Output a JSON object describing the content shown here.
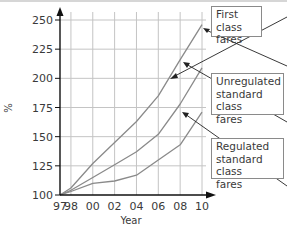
{
  "chart_data": {
    "type": "line",
    "title": "",
    "xlabel": "Year",
    "ylabel": "%",
    "x": [
      "97",
      "98",
      "00",
      "02",
      "04",
      "06",
      "08",
      "10"
    ],
    "x_numeric": [
      1997,
      1998,
      2000,
      2002,
      2004,
      2006,
      2008,
      2010
    ],
    "ylim": [
      100,
      250
    ],
    "yticks": [
      "100",
      "125",
      "150",
      "175",
      "200",
      "225",
      "250"
    ],
    "xticks": [
      "97",
      "98",
      "00",
      "02",
      "04",
      "06",
      "08",
      "10"
    ],
    "grid": true,
    "series": [
      {
        "name": "First class fares",
        "values": [
          100,
          106,
          127,
          145,
          163,
          185,
          216,
          246
        ]
      },
      {
        "name": "Unregulated standard class fares",
        "values": [
          100,
          104,
          115,
          126,
          137,
          152,
          178,
          209
        ]
      },
      {
        "name": "Regulated standard class fares",
        "values": [
          100,
          103,
          110,
          112,
          117,
          130,
          143,
          171
        ]
      }
    ],
    "legend": {
      "position": "right, callout boxes with arrows"
    },
    "annotations": [
      {
        "text": "First class fares",
        "points_to": "First class fares"
      },
      {
        "text": "Unregulated standard class fares",
        "points_to": "Unregulated standard class fares"
      },
      {
        "text": "Regulated standard class fares",
        "points_to": "Regulated standard class fares"
      }
    ]
  },
  "labels": {
    "first": [
      "First class",
      "fares"
    ],
    "unregulated": [
      "Unregulated",
      "standard class",
      "fares"
    ],
    "regulated": [
      "Regulated",
      "standard class",
      "fares"
    ]
  },
  "colors": {
    "line": "#8a8a8a",
    "grid": "#c4c4c4",
    "axis": "#111111",
    "text": "#3a3a3a"
  }
}
